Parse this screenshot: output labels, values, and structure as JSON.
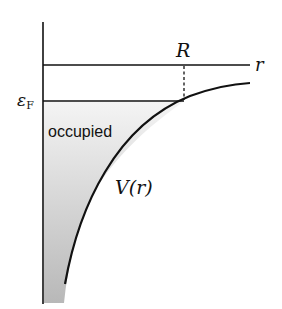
{
  "diagram": {
    "axis_label_r": "r",
    "label_R": "R",
    "label_fermi": "ε",
    "label_fermi_sub": "F",
    "label_occupied": "occupied",
    "label_potential": "V(r)"
  },
  "colors": {
    "line": "#111111",
    "fill_top": "#f2f2f2",
    "fill_bottom": "#bdbdbd"
  }
}
